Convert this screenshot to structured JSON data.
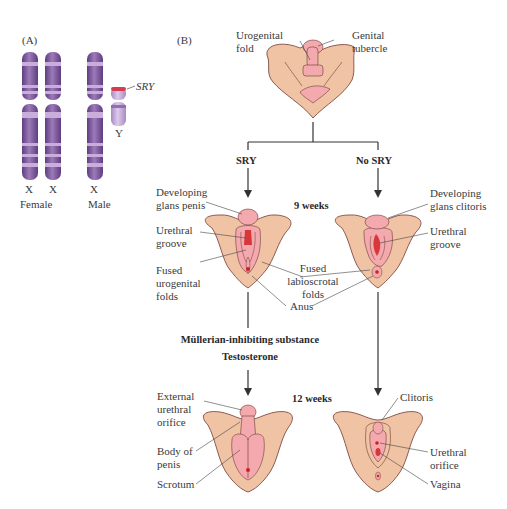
{
  "panels": {
    "a": {
      "label": "(A)",
      "chromosomes": [
        {
          "name": "X",
          "group": "Female"
        },
        {
          "name": "X",
          "group": "Female"
        },
        {
          "name": "X",
          "group": "Male"
        },
        {
          "name": "Y",
          "group": "Male"
        }
      ],
      "groups": [
        "Female",
        "Male"
      ],
      "gene_label": "SRY"
    },
    "b": {
      "label": "(B)",
      "top": {
        "labels": [
          "Urogenital\nfold",
          "Genital\ntubercle"
        ],
        "urogenital_fold": [
          "Urogenital",
          "fold"
        ],
        "genital_tubercle": [
          "Genital",
          "tubercle"
        ]
      },
      "branches": {
        "left": "SRY",
        "right": "No SRY"
      },
      "stage1": {
        "time": "9 weeks",
        "left": {
          "developing_glans": [
            "Developing",
            "glans penis"
          ],
          "urethral_groove": [
            "Urethral",
            "groove"
          ],
          "fused_urogenital": [
            "Fused",
            "urogenital",
            "folds"
          ]
        },
        "middle": {
          "fused_labioscrotal": [
            "Fused",
            "labioscrotal",
            "folds"
          ],
          "anus": "Anus"
        },
        "right": {
          "developing_glans": [
            "Developing",
            "glans clitoris"
          ],
          "urethral_groove": [
            "Urethral",
            "groove"
          ]
        }
      },
      "hormones": [
        "Müllerian-inhibiting substance",
        "Testosterone"
      ],
      "stage2": {
        "time": "12 weeks",
        "left": {
          "external_urethral_orifice": [
            "External",
            "urethral",
            "orifice"
          ],
          "body_of_penis": [
            "Body of",
            "penis"
          ],
          "scrotum": "Scrotum"
        },
        "right": {
          "clitoris": "Clitoris",
          "urethral_orifice": [
            "Urethral",
            "orifice"
          ],
          "vagina": "Vagina"
        }
      }
    }
  },
  "colors": {
    "chromosome": "#7d5a9c",
    "chromosome_band_light": "#c3a8d6",
    "chromosome_y": "#c9b3de",
    "sry_band": "#d83b4f",
    "skin": "#f0c3a4",
    "tissue_pink": "#f3a9ad",
    "tissue_red": "#d9383a",
    "outline": "#6e3a34",
    "line": "#333333"
  }
}
